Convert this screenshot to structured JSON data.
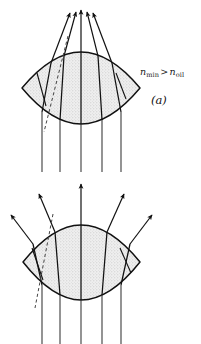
{
  "figure": {
    "background_color": "#ffffff",
    "ink_color": "#111111",
    "lens_fill_color": "#e9e9e9",
    "stipple_dot_color": "#b8b8b8"
  },
  "panels": [
    {
      "id": "a",
      "tag": "(a)",
      "condition_text": "n_min > n_oil",
      "condition": {
        "lhs_symbol": "n",
        "lhs_subscript": "min",
        "relation": ">",
        "rhs_symbol": "n",
        "rhs_subscript": "oil"
      },
      "behavior": "converging",
      "description": "Parallel rays entering from below converge to a focus above the lens",
      "lens": {
        "left_vertex_x": 22,
        "right_vertex_x": 140,
        "center_x": 81,
        "center_y": 88,
        "top_apex_y": 52,
        "bottom_apex_y": 124
      },
      "incoming_ray_x_positions": [
        42,
        60,
        81,
        102,
        121
      ],
      "ray_count": 5,
      "focus_x": 81,
      "focus_y": 8
    },
    {
      "id": "b",
      "tag": "(b)",
      "condition_text": "n_min < n_oil",
      "condition": {
        "lhs_symbol": "n",
        "lhs_subscript": "min",
        "relation": "<",
        "rhs_symbol": "n",
        "rhs_subscript": "oil"
      },
      "behavior": "diverging",
      "description": "Parallel rays entering from below diverge outward above the lens",
      "lens": {
        "left_vertex_x": 23,
        "right_vertex_x": 140,
        "center_x": 81,
        "center_y": 262,
        "top_apex_y": 225,
        "bottom_apex_y": 300
      },
      "incoming_ray_x_positions": [
        42,
        60,
        81,
        102,
        121
      ],
      "ray_count": 5,
      "virtual_focus_x": 81,
      "virtual_focus_y": 352
    }
  ]
}
